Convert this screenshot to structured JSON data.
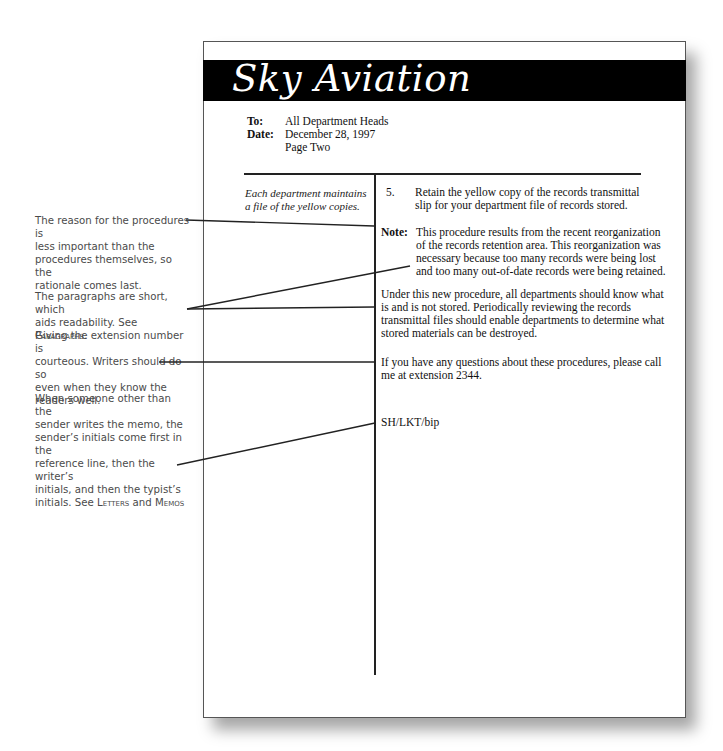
{
  "memo": {
    "company": "Sky Aviation",
    "header": {
      "to_label": "To:",
      "to_value": "All Department Heads",
      "date_label": "Date:",
      "date_value": "December 28, 1997",
      "page_value": "Page Two"
    },
    "margin_note": "Each department maintains a file of the yellow copies.",
    "item_number": "5.",
    "item_text": "Retain the yellow copy of the records transmittal slip for your department file of records stored.",
    "note_label": "Note:",
    "note_lines": [
      "This procedure results from the recent reorganization",
      "of  the records retention area. This reorganization was",
      "necessary because too many records were being lost",
      "and too many out-of-date records were being retained."
    ],
    "paragraph1_lines": [
      "Under this new procedure, all departments should know what",
      "is and is not stored. Periodically reviewing the records",
      "transmittal files should enable departments to determine what",
      "stored materials can be destroyed."
    ],
    "paragraph2_lines": [
      "If you have any questions about these procedures, please call",
      "me at extension 2344."
    ],
    "reference_initials": "SH/LKT/bip"
  },
  "annotations": [
    {
      "lines": [
        "The reason for the procedures is",
        "less important than the",
        "procedures themselves, so the",
        "rationale comes last."
      ]
    },
    {
      "lines": [
        "The paragraphs are short, which",
        "aids readability. See "
      ],
      "xref": "Paragraphs",
      "suffix": "."
    },
    {
      "lines": [
        "Giving the extension number is",
        "courteous. Writers should do so",
        "even when they know the",
        "readers well."
      ]
    },
    {
      "lines": [
        "When someone other than the",
        "sender writes the memo, the",
        "sender’s initials come first in the",
        "reference line, then the writer’s",
        "initials, and then the typist’s",
        "initials. See "
      ],
      "xref": "Letters",
      "mid": " and ",
      "xref2": "Memos"
    }
  ]
}
